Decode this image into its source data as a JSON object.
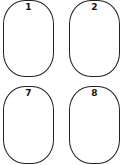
{
  "cards": [
    {
      "label": "1"
    },
    {
      "label": "2"
    },
    {
      "label": "7"
    },
    {
      "label": "8"
    }
  ]
}
